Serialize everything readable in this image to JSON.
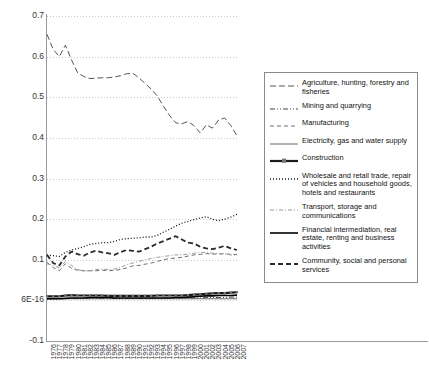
{
  "chart_data": {
    "type": "line",
    "title": "",
    "xlabel": "",
    "ylabel": "",
    "ylim": [
      -0.1,
      0.7
    ],
    "ytick_labels": [
      "0.7",
      "0.6",
      "0.5",
      "0.4",
      "0.3",
      "0.2",
      "0.1",
      "6E-16",
      "-0.1"
    ],
    "ytick_values": [
      0.7,
      0.6,
      0.5,
      0.4,
      0.3,
      0.2,
      0.1,
      0.0,
      -0.1
    ],
    "grid": true,
    "grid_axis": "y",
    "legend_position": "right",
    "categories": [
      1976,
      1977,
      1978,
      1979,
      1980,
      1981,
      1982,
      1983,
      1984,
      1985,
      1986,
      1987,
      1988,
      1989,
      1990,
      1991,
      1992,
      1993,
      1994,
      1995,
      1996,
      1997,
      1998,
      1999,
      2000,
      2001,
      2002,
      2003,
      2004,
      2005,
      2006,
      2007
    ],
    "series": [
      {
        "name": "Agriculture, hunting, forestry and fisheries",
        "style": "long-dash",
        "color": "#555555",
        "values": [
          0.655,
          0.618,
          0.6,
          0.628,
          0.592,
          0.56,
          0.551,
          0.546,
          0.547,
          0.548,
          0.548,
          0.55,
          0.553,
          0.558,
          0.559,
          0.548,
          0.534,
          0.52,
          0.503,
          0.478,
          0.455,
          0.437,
          0.435,
          0.44,
          0.43,
          0.412,
          0.432,
          0.424,
          0.444,
          0.449,
          0.43,
          0.405
        ]
      },
      {
        "name": "Mining and quarrying",
        "style": "dash-dot-dot",
        "color": "#444444",
        "values": [
          0.004,
          0.004,
          0.004,
          0.005,
          0.005,
          0.005,
          0.005,
          0.005,
          0.005,
          0.005,
          0.005,
          0.005,
          0.005,
          0.005,
          0.005,
          0.005,
          0.005,
          0.005,
          0.006,
          0.006,
          0.006,
          0.006,
          0.006,
          0.006,
          0.006,
          0.006,
          0.007,
          0.007,
          0.007,
          0.007,
          0.008,
          0.008
        ]
      },
      {
        "name": "Manufacturing",
        "style": "dash",
        "color": "#6f6f6f",
        "values": [
          0.094,
          0.081,
          0.073,
          0.09,
          0.079,
          0.074,
          0.073,
          0.073,
          0.073,
          0.074,
          0.073,
          0.074,
          0.076,
          0.08,
          0.085,
          0.086,
          0.089,
          0.092,
          0.096,
          0.1,
          0.103,
          0.104,
          0.106,
          0.109,
          0.112,
          0.113,
          0.115,
          0.114,
          0.114,
          0.115,
          0.113,
          0.113
        ]
      },
      {
        "name": "Electricity, gas and water supply",
        "style": "thin-solid",
        "color": "#555555",
        "values": [
          0.004,
          0.004,
          0.004,
          0.004,
          0.004,
          0.004,
          0.004,
          0.004,
          0.004,
          0.004,
          0.004,
          0.004,
          0.004,
          0.004,
          0.004,
          0.004,
          0.004,
          0.004,
          0.004,
          0.004,
          0.004,
          0.004,
          0.004,
          0.004,
          0.004,
          0.004,
          0.004,
          0.004,
          0.004,
          0.004,
          0.004,
          0.004
        ]
      },
      {
        "name": "Construction",
        "style": "thick-solid-marker",
        "color": "#1a1a1a",
        "values": [
          0.01,
          0.01,
          0.01,
          0.012,
          0.013,
          0.012,
          0.012,
          0.012,
          0.012,
          0.012,
          0.011,
          0.011,
          0.011,
          0.011,
          0.011,
          0.011,
          0.011,
          0.011,
          0.012,
          0.012,
          0.012,
          0.012,
          0.012,
          0.013,
          0.014,
          0.015,
          0.016,
          0.017,
          0.018,
          0.018,
          0.019,
          0.02
        ]
      },
      {
        "name": "Wholesale and retail trade, repair of vehicles and household goods, hotels and restaurants",
        "style": "dotted",
        "color": "#111111",
        "values": [
          0.112,
          0.11,
          0.108,
          0.118,
          0.124,
          0.128,
          0.132,
          0.138,
          0.14,
          0.142,
          0.142,
          0.145,
          0.15,
          0.152,
          0.153,
          0.154,
          0.156,
          0.156,
          0.16,
          0.168,
          0.175,
          0.183,
          0.19,
          0.194,
          0.199,
          0.203,
          0.206,
          0.2,
          0.196,
          0.2,
          0.205,
          0.212
        ]
      },
      {
        "name": "Transport, storage and communications",
        "style": "dash-dot",
        "color": "#9a9a9a",
        "values": [
          0.09,
          0.086,
          0.08,
          0.095,
          0.086,
          0.076,
          0.072,
          0.073,
          0.076,
          0.077,
          0.076,
          0.077,
          0.081,
          0.088,
          0.092,
          0.096,
          0.1,
          0.103,
          0.106,
          0.108,
          0.11,
          0.112,
          0.112,
          0.114,
          0.116,
          0.118,
          0.118,
          0.116,
          0.115,
          0.114,
          0.112,
          0.111
        ]
      },
      {
        "name": "Financial intermediation, real estate, renting and business activities",
        "style": "thick-solid",
        "color": "#000000",
        "values": [
          0.004,
          0.004,
          0.004,
          0.005,
          0.006,
          0.006,
          0.006,
          0.007,
          0.007,
          0.007,
          0.007,
          0.006,
          0.006,
          0.006,
          0.006,
          0.006,
          0.006,
          0.006,
          0.006,
          0.006,
          0.006,
          0.007,
          0.007,
          0.008,
          0.009,
          0.01,
          0.011,
          0.011,
          0.012,
          0.012,
          0.012,
          0.013
        ]
      },
      {
        "name": "Community, social and personal services",
        "style": "thick-dash",
        "color": "#2b2b2b",
        "values": [
          0.112,
          0.092,
          0.086,
          0.108,
          0.12,
          0.114,
          0.11,
          0.118,
          0.122,
          0.118,
          0.116,
          0.112,
          0.119,
          0.124,
          0.122,
          0.12,
          0.126,
          0.132,
          0.14,
          0.146,
          0.152,
          0.158,
          0.15,
          0.142,
          0.14,
          0.132,
          0.128,
          0.126,
          0.13,
          0.134,
          0.128,
          0.124
        ]
      }
    ]
  },
  "legend": {
    "items": [
      {
        "label": "Agriculture, hunting, forestry and fisheries"
      },
      {
        "label": "Mining and quarrying"
      },
      {
        "label": "Manufacturing"
      },
      {
        "label": "Electricity, gas and water supply"
      },
      {
        "label": "Construction"
      },
      {
        "label": "Wholesale and retail trade, repair of vehicles and household goods, hotels and restaurants"
      },
      {
        "label": "Transport, storage and communications"
      },
      {
        "label": "Financial intermediation, real estate, renting and business activities"
      },
      {
        "label": "Community, social and personal services"
      }
    ]
  }
}
